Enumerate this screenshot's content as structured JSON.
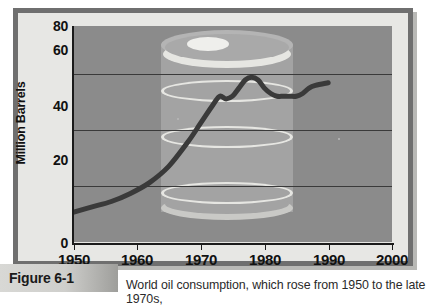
{
  "figure": {
    "badge_label": "Figure 6-1",
    "caption": "World oil consumption, which rose from 1950 to the late 1970s,"
  },
  "axes": {
    "y_title": "Million Barrels",
    "y_ticks": [
      "0",
      "20",
      "40",
      "60",
      "80"
    ],
    "x_ticks": [
      "1950",
      "1960",
      "1970",
      "1980",
      "1990",
      "2000"
    ]
  },
  "colors": {
    "frame": "#6f6f6f",
    "panel": "#e7e7e4",
    "plot_background": "#8b8b8b",
    "barrel_body": "#a3a3a3",
    "barrel_ring": "#e6e6e2",
    "gridline": "#3a3a3a",
    "curve": "#3a3a3a"
  },
  "chart_data": {
    "type": "line",
    "title": "World oil consumption",
    "xlabel": "",
    "ylabel": "Million Barrels",
    "xlim": [
      1950,
      2000
    ],
    "ylim": [
      0,
      80
    ],
    "grid": true,
    "legend": null,
    "x_tick_values": [
      1950,
      1960,
      1970,
      1980,
      1990,
      2000
    ],
    "y_tick_values": [
      0,
      20,
      40,
      60,
      80
    ],
    "series": [
      {
        "name": "World oil consumption",
        "x": [
          1950,
          1953,
          1956,
          1959,
          1962,
          1965,
          1968,
          1970,
          1972,
          1973,
          1974,
          1975,
          1976,
          1977,
          1978,
          1979,
          1980,
          1981,
          1982,
          1983,
          1984,
          1985,
          1986,
          1987,
          1988,
          1990
        ],
        "values": [
          11,
          13,
          15,
          18,
          22,
          28,
          37,
          44,
          51,
          54,
          53,
          54,
          57,
          60,
          61,
          60,
          57,
          55,
          54,
          54,
          54,
          54,
          55,
          57,
          58,
          59
        ]
      }
    ]
  }
}
